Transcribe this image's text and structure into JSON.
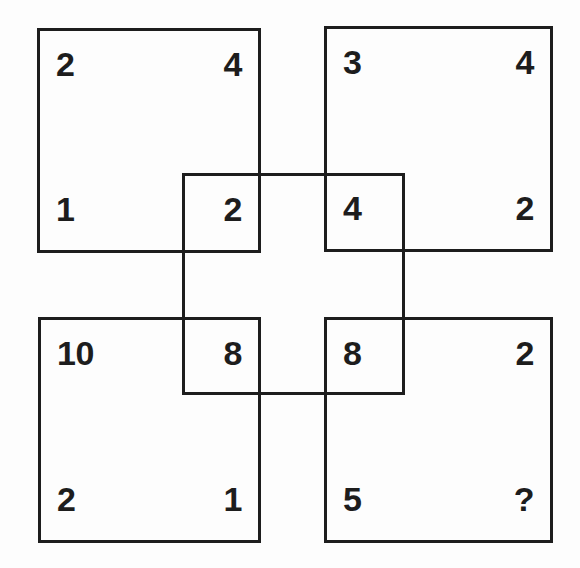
{
  "figure": {
    "colors": {
      "background": "#fdfdfd",
      "line": "#1d1d1d",
      "text": "#1d1d1d"
    },
    "squares": {
      "top_left": {
        "corners": {
          "top_left": "2",
          "top_right": "4",
          "bottom_left": "1",
          "bottom_right": "2"
        }
      },
      "top_right": {
        "corners": {
          "top_left": "3",
          "top_right": "4",
          "bottom_left": "4",
          "bottom_right": "2"
        }
      },
      "bottom_left": {
        "corners": {
          "top_left": "10",
          "top_right": "8",
          "bottom_left": "2",
          "bottom_right": "1"
        }
      },
      "bottom_right": {
        "corners": {
          "top_left": "8",
          "top_right": "2",
          "bottom_left": "5",
          "bottom_right": "?"
        }
      }
    }
  }
}
